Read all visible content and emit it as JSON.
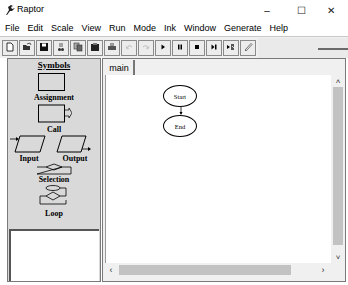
{
  "window": {
    "title": "Raptor",
    "controls": {
      "minimize": "–",
      "maximize": "☐",
      "close": "✕"
    }
  },
  "menu": {
    "items": [
      "File",
      "Edit",
      "Scale",
      "View",
      "Run",
      "Mode",
      "Ink",
      "Window",
      "Generate",
      "Help"
    ]
  },
  "toolbar": {
    "buttons": [
      {
        "name": "new-icon",
        "enabled": true
      },
      {
        "name": "open-icon",
        "enabled": true
      },
      {
        "name": "save-icon",
        "enabled": true
      },
      {
        "name": "cut-icon",
        "enabled": true
      },
      {
        "name": "copy-icon",
        "enabled": true
      },
      {
        "name": "paste-icon",
        "enabled": true
      },
      {
        "name": "print-icon",
        "enabled": true
      },
      {
        "name": "undo-icon",
        "enabled": false
      },
      {
        "name": "redo-icon",
        "enabled": false
      },
      {
        "name": "play-icon",
        "enabled": true
      },
      {
        "name": "pause-icon",
        "enabled": true
      },
      {
        "name": "stop-icon",
        "enabled": true
      },
      {
        "name": "step-icon",
        "enabled": true
      },
      {
        "name": "step-into-icon",
        "enabled": true
      },
      {
        "name": "pen-icon",
        "enabled": true
      }
    ]
  },
  "symbols_panel": {
    "header": "Symbols",
    "items": [
      {
        "label": "Assignment"
      },
      {
        "label": "Call"
      },
      {
        "label": "Input"
      },
      {
        "label": "Output"
      },
      {
        "label": "Selection"
      },
      {
        "label": "Loop"
      }
    ]
  },
  "tabs": [
    {
      "label": "main",
      "active": true
    }
  ],
  "flowchart": {
    "nodes": [
      {
        "label": "Start"
      },
      {
        "label": "End"
      }
    ]
  },
  "scrollbars": {
    "up": "˄",
    "down": "˅",
    "left": "‹",
    "right": "›"
  }
}
